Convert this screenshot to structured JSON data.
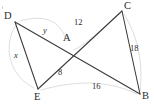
{
  "figure": {
    "background_color": "#ffffff",
    "line_color": "#3a3a3a",
    "arc_color": "#d9d9d9",
    "text_color": "#2b2b2b",
    "width": 154,
    "height": 107
  },
  "vertices": [
    {
      "id": "D",
      "label": "D",
      "x": 15,
      "y": 22,
      "label_x": 4,
      "label_y": 11
    },
    {
      "id": "C",
      "label": "C",
      "x": 122,
      "y": 11,
      "label_x": 124,
      "label_y": 1
    },
    {
      "id": "A",
      "label": "A",
      "x": 72,
      "y": 52,
      "label_x": 63,
      "label_y": 33
    },
    {
      "id": "E",
      "label": "E",
      "x": 38,
      "y": 89,
      "label_x": 34,
      "label_y": 92
    },
    {
      "id": "B",
      "label": "B",
      "x": 140,
      "y": 94,
      "label_x": 142,
      "label_y": 91
    }
  ],
  "segments": [
    {
      "id": "DB",
      "from": "D",
      "to": "B",
      "note": "passes through A"
    },
    {
      "id": "CE",
      "from": "C",
      "to": "E",
      "note": "passes through A"
    },
    {
      "id": "DE",
      "from": "D",
      "to": "E",
      "note": "left side"
    },
    {
      "id": "CB",
      "from": "C",
      "to": "B",
      "note": "right side"
    }
  ],
  "measures": [
    {
      "id": "DA",
      "text": "y",
      "kind": "variable",
      "x": 43,
      "y": 26,
      "segment": "D to A"
    },
    {
      "id": "DE",
      "text": "x",
      "kind": "variable",
      "x": 14,
      "y": 51,
      "segment": "D to E"
    },
    {
      "id": "EA",
      "text": "8",
      "kind": "number",
      "x": 58,
      "y": 68,
      "segment": "E to A"
    },
    {
      "id": "CA",
      "text": "12",
      "kind": "number",
      "x": 74,
      "y": 18,
      "segment": "C to A"
    },
    {
      "id": "AB",
      "text": "16",
      "kind": "number",
      "x": 92,
      "y": 82,
      "segment": "A to B"
    },
    {
      "id": "CB",
      "text": "18",
      "kind": "number",
      "x": 130,
      "y": 44,
      "segment": "C to B"
    }
  ],
  "arcs": [
    {
      "id": "arc-d-e",
      "d": "M 16 25 C 4 42, 6 74, 34 88"
    },
    {
      "id": "arc-e-b",
      "d": "M 41 90 C 70 82, 104 78, 137 94"
    },
    {
      "id": "arc-c-b",
      "d": "M 124 14 C 139 38, 143 66, 140 91"
    },
    {
      "id": "arc-d-c",
      "d": "M 20 21 C 44 14, 60 20, 66 40"
    },
    {
      "id": "arc-a-c",
      "d": "M 74 50 C 92 40, 110 22, 119 13"
    }
  ]
}
